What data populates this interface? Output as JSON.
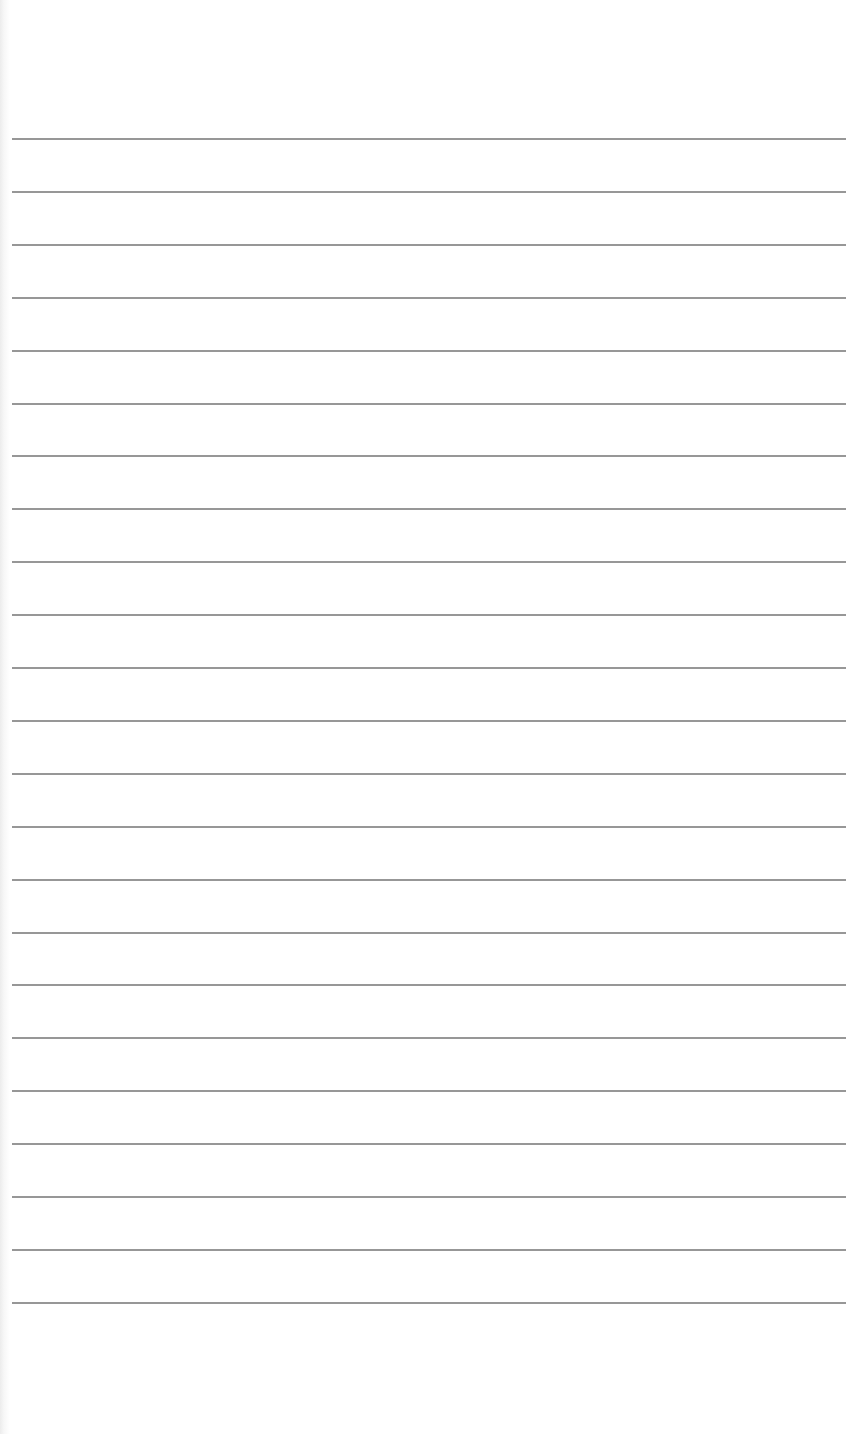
{
  "paper": {
    "type": "lined-paper",
    "background_color": "#ffffff",
    "line_color": "#8c8c8c",
    "line_count": 23,
    "first_line_y": 138,
    "line_spacing": 52.9,
    "line_left": 12
  }
}
